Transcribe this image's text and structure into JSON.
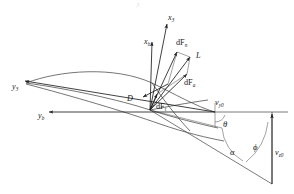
{
  "figure": {
    "kind": "vector-diagram",
    "caption": "",
    "background_color": "#ffffff",
    "line_color": "#333333",
    "label_color": "#1a1a1a",
    "width": 294,
    "height": 194
  },
  "labels": {
    "x3": {
      "base": "x",
      "sub": "3"
    },
    "xb": {
      "base": "x",
      "sub": "b"
    },
    "y3": {
      "base": "y",
      "sub": "3"
    },
    "yb": {
      "base": "y",
      "sub": "b"
    },
    "dFn": {
      "base": "dF",
      "sub": "n"
    },
    "dFa": {
      "base": "dF",
      "sub": "a"
    },
    "dFt": {
      "base": "dF",
      "sub": "t"
    },
    "L": {
      "base": "L",
      "sub": ""
    },
    "D": {
      "base": "D",
      "sub": ""
    },
    "vy0": {
      "base": "v",
      "sub": "y0"
    },
    "vz0": {
      "base": "v",
      "sub": "z0"
    },
    "theta": {
      "base": "θ",
      "sub": ""
    },
    "alpha": {
      "base": "α",
      "sub": ""
    },
    "phi": {
      "base": "ϕ",
      "sub": ""
    },
    "ghost_top": "y"
  },
  "vectors": [
    {
      "name": "x3-axis",
      "label": "x3",
      "from": [
        150,
        110
      ],
      "to": [
        167,
        22
      ]
    },
    {
      "name": "xb-axis",
      "label": "xb",
      "from": [
        150,
        110
      ],
      "to": [
        152,
        40
      ]
    },
    {
      "name": "dFn",
      "label": "dFn",
      "from": [
        150,
        110
      ],
      "to": [
        178,
        49
      ]
    },
    {
      "name": "L",
      "label": "L",
      "from": [
        150,
        110
      ],
      "to": [
        192,
        55
      ]
    },
    {
      "name": "dFa",
      "label": "dFa",
      "from": [
        150,
        110
      ],
      "to": [
        190,
        72
      ]
    },
    {
      "name": "dFt",
      "label": "dFt",
      "from": [
        150,
        110
      ],
      "to": [
        157,
        92
      ]
    },
    {
      "name": "D",
      "label": "D",
      "from": [
        168,
        84
      ],
      "to": [
        141,
        98
      ]
    },
    {
      "name": "yb-axis",
      "label": "yb",
      "from": [
        215,
        112
      ],
      "to": [
        47,
        112
      ]
    },
    {
      "name": "y3-axis",
      "label": "y3",
      "from": [
        215,
        112
      ],
      "to": [
        23,
        80
      ]
    },
    {
      "name": "vz0",
      "label": "vz0",
      "from": [
        272,
        184
      ],
      "to": [
        272,
        112
      ]
    }
  ],
  "angles": [
    {
      "name": "theta",
      "label": "θ",
      "vertex": [
        215,
        112
      ],
      "at": [
        220,
        122
      ]
    },
    {
      "name": "alpha",
      "label": "α",
      "vertex": [
        215,
        112
      ],
      "at": [
        235,
        148
      ]
    },
    {
      "name": "phi",
      "label": "ϕ",
      "vertex": [
        272,
        112
      ],
      "at": [
        258,
        145
      ]
    }
  ],
  "text_positions": {
    "x3": [
      168,
      20
    ],
    "xb": [
      146,
      42
    ],
    "y3": [
      16,
      88
    ],
    "yb": [
      41,
      117
    ],
    "dFn": [
      178,
      48
    ],
    "L": [
      195,
      57
    ],
    "dFa": [
      187,
      83
    ],
    "dFt": [
      158,
      108
    ],
    "D": [
      131,
      100
    ],
    "vy0": [
      218,
      105
    ],
    "vz0": [
      276,
      153
    ],
    "theta": [
      224,
      126
    ],
    "alpha": [
      232,
      153
    ],
    "phi": [
      255,
      148
    ]
  }
}
